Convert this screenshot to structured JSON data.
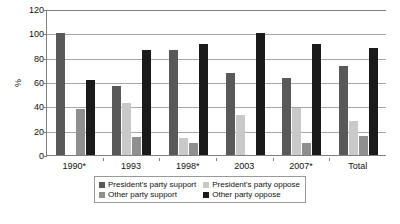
{
  "chart_data": {
    "type": "bar",
    "title": "",
    "xlabel": "",
    "ylabel": "%",
    "ylim": [
      0,
      120
    ],
    "yticks": [
      0,
      20,
      40,
      60,
      80,
      100,
      120
    ],
    "grid": true,
    "legend_position": "bottom",
    "categories": [
      "1990*",
      "1993",
      "1998*",
      "2003",
      "2007*",
      "Total"
    ],
    "series": [
      {
        "name": "President's party support",
        "color": "#595959",
        "values": [
          100,
          57,
          86,
          67,
          63,
          73
        ]
      },
      {
        "name": "President's party oppose",
        "color": "#c9c9c9",
        "values": [
          0,
          43,
          14,
          33,
          39,
          28
        ]
      },
      {
        "name": "Other party support",
        "color": "#8f8f8f",
        "values": [
          38,
          15,
          10,
          0,
          10,
          16
        ]
      },
      {
        "name": "Other party oppose",
        "color": "#1a1a1a",
        "values": [
          62,
          86,
          91,
          100,
          91,
          88
        ]
      }
    ]
  },
  "axes": {
    "y_title": "%",
    "y_tick_labels": [
      "120",
      "100",
      "80",
      "60",
      "40",
      "20",
      "0"
    ],
    "x_tick_labels": [
      "1990*",
      "1993",
      "1998*",
      "2003",
      "2007*",
      "Total"
    ]
  },
  "legend": {
    "entries": [
      {
        "label": "President's party support",
        "color": "#595959"
      },
      {
        "label": "President's party oppose",
        "color": "#c9c9c9"
      },
      {
        "label": "Other party support",
        "color": "#8f8f8f"
      },
      {
        "label": "Other party oppose",
        "color": "#1a1a1a"
      }
    ]
  },
  "colors": {
    "axis": "#808080",
    "gridline": "#a6a6a6",
    "text": "#111111",
    "background": "#ffffff",
    "legend_border": "#999999"
  }
}
